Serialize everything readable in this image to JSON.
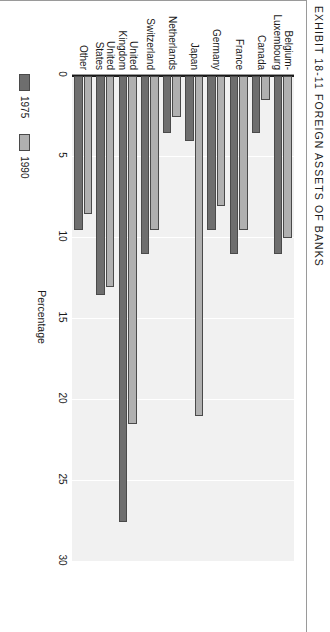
{
  "figure": {
    "exhibit_label": "EXHIBIT 18-11",
    "exhibit_title": "FOREIGN ASSETS OF BANKS",
    "header": "EXHIBIT 18-11   FOREIGN ASSETS OF BANKS"
  },
  "legend": {
    "position": "bottom-left",
    "items": [
      {
        "label": "1975",
        "color": "#6e6e6e"
      },
      {
        "label": "1990",
        "color": "#b0b0b0"
      }
    ]
  },
  "chart_data": {
    "type": "bar",
    "title": "EXHIBIT 18-11   FOREIGN ASSETS OF BANKS",
    "orientation": "vertical",
    "xlabel": "",
    "ylabel": "Percentage",
    "ylim": [
      0,
      30
    ],
    "yticks": [
      0,
      5,
      10,
      15,
      20,
      25,
      30
    ],
    "ytick_labels": [
      "0",
      "5",
      "10",
      "15",
      "20",
      "25",
      "30"
    ],
    "grid": true,
    "legend_position": "bottom-left",
    "categories": [
      "Belgium-\nLuxembourg",
      "Canada",
      "France",
      "Germany",
      "Japan",
      "Netherlands",
      "Switzerland",
      "United\nKingdom",
      "United\nStates",
      "Other"
    ],
    "series": [
      {
        "name": "1975",
        "color": "#6e6e6e",
        "values": [
          11,
          3.5,
          11,
          9.5,
          4,
          3.5,
          11,
          27.5,
          13.5,
          9.5
        ]
      },
      {
        "name": "1990",
        "color": "#b0b0b0",
        "values": [
          10,
          1.5,
          9.5,
          8,
          21,
          2.5,
          9.5,
          21.5,
          13,
          8.5
        ]
      }
    ]
  }
}
